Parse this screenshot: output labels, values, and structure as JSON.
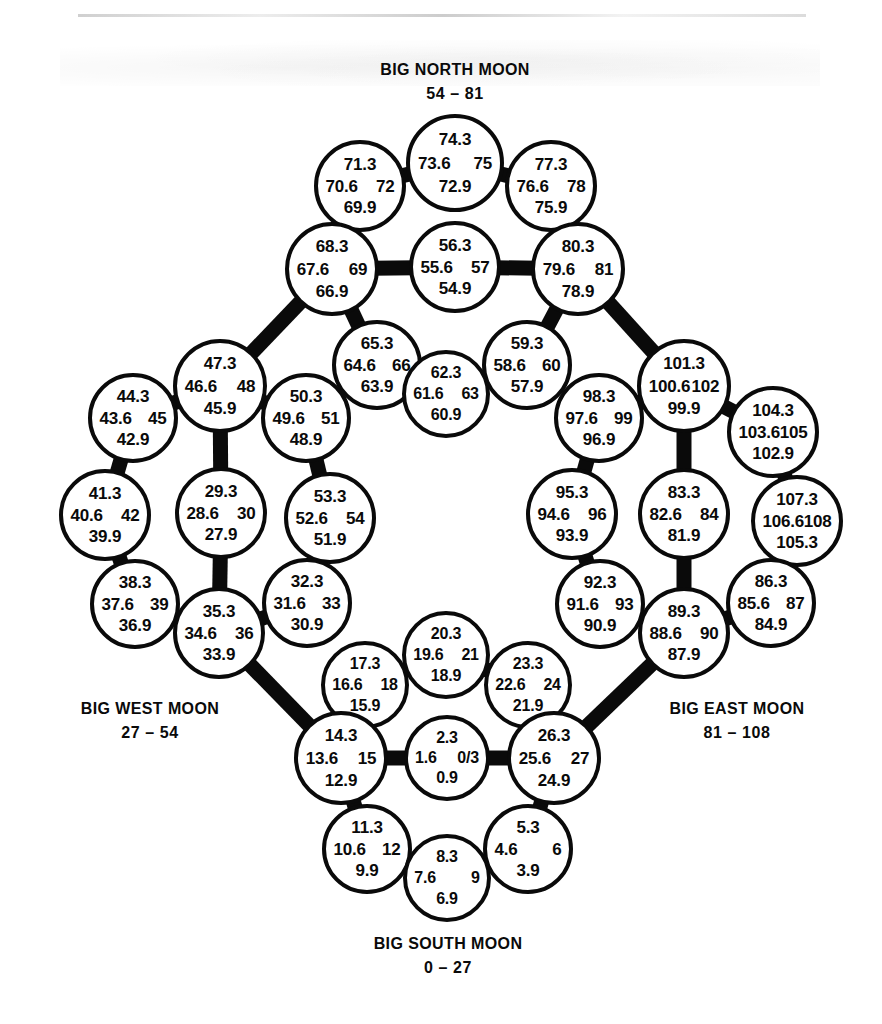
{
  "page": {
    "background": "#ffffff",
    "ink": "#0a0a0a"
  },
  "captions": [
    {
      "name": "north",
      "title": "BIG NORTH MOON",
      "range": "54 – 81",
      "x": 455,
      "y": 58
    },
    {
      "name": "west",
      "title": "BIG WEST MOON",
      "range": "27 – 54",
      "x": 150,
      "y": 697
    },
    {
      "name": "east",
      "title": "BIG EAST MOON",
      "range": "81 – 108",
      "x": 737,
      "y": 697
    },
    {
      "name": "south",
      "title": "BIG SOUTH MOON",
      "range": "0 – 27",
      "x": 448,
      "y": 932
    }
  ],
  "moons": [
    {
      "id": "m74",
      "cx": 455,
      "cy": 163,
      "r": 49,
      "top": "74.3",
      "left": "73.6",
      "right": "75",
      "bottom": "72.9"
    },
    {
      "id": "m71",
      "cx": 360,
      "cy": 186,
      "r": 46,
      "top": "71.3",
      "left": "70.6",
      "right": "72",
      "bottom": "69.9"
    },
    {
      "id": "m77",
      "cx": 551,
      "cy": 186,
      "r": 46,
      "top": "77.3",
      "left": "76.6",
      "right": "78",
      "bottom": "75.9"
    },
    {
      "id": "m68",
      "cx": 332,
      "cy": 269,
      "r": 47,
      "top": "68.3",
      "left": "67.6",
      "right": "69",
      "bottom": "66.9"
    },
    {
      "id": "m56",
      "cx": 455,
      "cy": 267,
      "r": 46,
      "top": "56.3",
      "left": "55.6",
      "right": "57",
      "bottom": "54.9"
    },
    {
      "id": "m80",
      "cx": 578,
      "cy": 269,
      "r": 47,
      "top": "80.3",
      "left": "79.6",
      "right": "81",
      "bottom": "78.9"
    },
    {
      "id": "m65",
      "cx": 377,
      "cy": 365,
      "r": 45,
      "top": "65.3",
      "left": "64.6",
      "right": "66",
      "bottom": "63.9"
    },
    {
      "id": "m62",
      "cx": 446,
      "cy": 394,
      "r": 44,
      "top": "62.3",
      "left": "61.6",
      "right": "63",
      "bottom": "60.9"
    },
    {
      "id": "m59",
      "cx": 527,
      "cy": 365,
      "r": 45,
      "top": "59.3",
      "left": "58.6",
      "right": "60",
      "bottom": "57.9"
    },
    {
      "id": "m47",
      "cx": 220,
      "cy": 386,
      "r": 47,
      "top": "47.3",
      "left": "46.6",
      "right": "48",
      "bottom": "45.9"
    },
    {
      "id": "m44",
      "cx": 133,
      "cy": 418,
      "r": 45,
      "top": "44.3",
      "left": "43.6",
      "right": "45",
      "bottom": "42.9"
    },
    {
      "id": "m50",
      "cx": 306,
      "cy": 418,
      "r": 45,
      "top": "50.3",
      "left": "49.6",
      "right": "51",
      "bottom": "48.9"
    },
    {
      "id": "m41",
      "cx": 105,
      "cy": 515,
      "r": 46,
      "top": "41.3",
      "left": "40.6",
      "right": "42",
      "bottom": "39.9"
    },
    {
      "id": "m29",
      "cx": 221,
      "cy": 513,
      "r": 46,
      "top": "29.3",
      "left": "28.6",
      "right": "30",
      "bottom": "27.9"
    },
    {
      "id": "m53",
      "cx": 330,
      "cy": 518,
      "r": 46,
      "top": "53.3",
      "left": "52.6",
      "right": "54",
      "bottom": "51.9"
    },
    {
      "id": "m38",
      "cx": 135,
      "cy": 604,
      "r": 45,
      "top": "38.3",
      "left": "37.6",
      "right": "39",
      "bottom": "36.9"
    },
    {
      "id": "m35",
      "cx": 219,
      "cy": 633,
      "r": 46,
      "top": "35.3",
      "left": "34.6",
      "right": "36",
      "bottom": "33.9"
    },
    {
      "id": "m32",
      "cx": 307,
      "cy": 603,
      "r": 45,
      "top": "32.3",
      "left": "31.6",
      "right": "33",
      "bottom": "30.9"
    },
    {
      "id": "m20",
      "cx": 446,
      "cy": 655,
      "r": 44,
      "top": "20.3",
      "left": "19.6",
      "right": "21",
      "bottom": "18.9"
    },
    {
      "id": "m17",
      "cx": 365,
      "cy": 685,
      "r": 44,
      "top": "17.3",
      "left": "16.6",
      "right": "18",
      "bottom": "15.9"
    },
    {
      "id": "m23",
      "cx": 528,
      "cy": 685,
      "r": 44,
      "top": "23.3",
      "left": "22.6",
      "right": "24",
      "bottom": "21.9"
    },
    {
      "id": "m14",
      "cx": 341,
      "cy": 758,
      "r": 47,
      "top": "14.3",
      "left": "13.6",
      "right": "15",
      "bottom": "12.9"
    },
    {
      "id": "m2",
      "cx": 447,
      "cy": 758,
      "r": 43,
      "top": "2.3",
      "left": "1.6",
      "right": "0/3",
      "bottom": "0.9"
    },
    {
      "id": "m26",
      "cx": 554,
      "cy": 758,
      "r": 47,
      "top": "26.3",
      "left": "25.6",
      "right": "27",
      "bottom": "24.9"
    },
    {
      "id": "m11",
      "cx": 367,
      "cy": 849,
      "r": 45,
      "top": "11.3",
      "left": "10.6",
      "right": "12",
      "bottom": "9.9"
    },
    {
      "id": "m8",
      "cx": 447,
      "cy": 878,
      "r": 44,
      "top": "8.3",
      "left": "7.6",
      "right": "9",
      "bottom": "6.9"
    },
    {
      "id": "m5",
      "cx": 528,
      "cy": 849,
      "r": 45,
      "top": "5.3",
      "left": "4.6",
      "right": "6",
      "bottom": "3.9"
    },
    {
      "id": "m101",
      "cx": 684,
      "cy": 386,
      "r": 47,
      "top": "101.3",
      "left": "100.6",
      "right": "102",
      "bottom": "99.9"
    },
    {
      "id": "m98",
      "cx": 599,
      "cy": 418,
      "r": 45,
      "top": "98.3",
      "left": "97.6",
      "right": "99",
      "bottom": "96.9"
    },
    {
      "id": "m104",
      "cx": 773,
      "cy": 432,
      "r": 46,
      "top": "104.3",
      "left": "103.6",
      "right": "105",
      "bottom": "102.9"
    },
    {
      "id": "m95",
      "cx": 572,
      "cy": 514,
      "r": 46,
      "top": "95.3",
      "left": "94.6",
      "right": "96",
      "bottom": "93.9"
    },
    {
      "id": "m83",
      "cx": 684,
      "cy": 514,
      "r": 46,
      "top": "83.3",
      "left": "82.6",
      "right": "84",
      "bottom": "81.9"
    },
    {
      "id": "m107",
      "cx": 797,
      "cy": 521,
      "r": 46,
      "top": "107.3",
      "left": "106.6",
      "right": "108",
      "bottom": "105.3"
    },
    {
      "id": "m92",
      "cx": 600,
      "cy": 604,
      "r": 45,
      "top": "92.3",
      "left": "91.6",
      "right": "93",
      "bottom": "90.9"
    },
    {
      "id": "m89",
      "cx": 684,
      "cy": 633,
      "r": 46,
      "top": "89.3",
      "left": "88.6",
      "right": "90",
      "bottom": "87.9"
    },
    {
      "id": "m86",
      "cx": 771,
      "cy": 603,
      "r": 45,
      "top": "86.3",
      "left": "85.6",
      "right": "87",
      "bottom": "84.9"
    }
  ],
  "chains": {
    "description": "thick black bands linking adjacent moons",
    "links": [
      [
        "m71",
        "m74"
      ],
      [
        "m74",
        "m77"
      ],
      [
        "m71",
        "m68"
      ],
      [
        "m77",
        "m80"
      ],
      [
        "m68",
        "m56"
      ],
      [
        "m56",
        "m80"
      ],
      [
        "m68",
        "m65"
      ],
      [
        "m65",
        "m62"
      ],
      [
        "m62",
        "m59"
      ],
      [
        "m59",
        "m80"
      ],
      [
        "m68",
        "m47"
      ],
      [
        "m47",
        "m44"
      ],
      [
        "m44",
        "m41"
      ],
      [
        "m41",
        "m38"
      ],
      [
        "m38",
        "m35"
      ],
      [
        "m47",
        "m29"
      ],
      [
        "m29",
        "m35"
      ],
      [
        "m47",
        "m50"
      ],
      [
        "m50",
        "m53"
      ],
      [
        "m53",
        "m32"
      ],
      [
        "m32",
        "m35"
      ],
      [
        "m35",
        "m14"
      ],
      [
        "m14",
        "m17"
      ],
      [
        "m17",
        "m20"
      ],
      [
        "m20",
        "m23"
      ],
      [
        "m23",
        "m26"
      ],
      [
        "m14",
        "m2"
      ],
      [
        "m2",
        "m26"
      ],
      [
        "m14",
        "m11"
      ],
      [
        "m11",
        "m8"
      ],
      [
        "m8",
        "m5"
      ],
      [
        "m5",
        "m26"
      ],
      [
        "m26",
        "m89"
      ],
      [
        "m89",
        "m86"
      ],
      [
        "m86",
        "m107"
      ],
      [
        "m107",
        "m104"
      ],
      [
        "m104",
        "m101"
      ],
      [
        "m89",
        "m83"
      ],
      [
        "m83",
        "m101"
      ],
      [
        "m89",
        "m92"
      ],
      [
        "m92",
        "m95"
      ],
      [
        "m95",
        "m98"
      ],
      [
        "m98",
        "m101"
      ],
      [
        "m101",
        "m80"
      ]
    ]
  }
}
